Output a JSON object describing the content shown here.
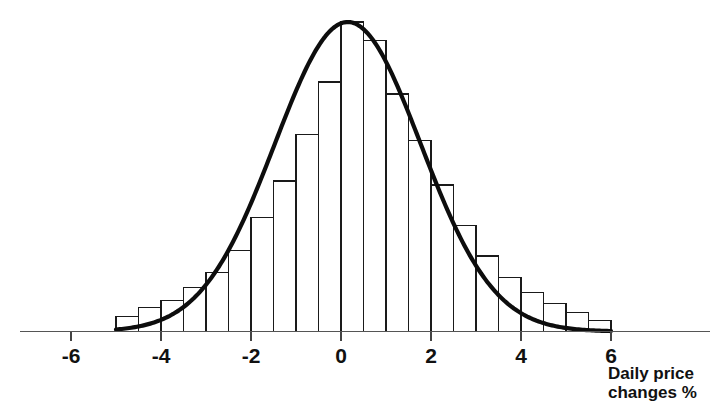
{
  "chart_data": {
    "type": "bar",
    "title": "",
    "subtitle": "",
    "xlabel": "Daily price changes %",
    "ylabel": "",
    "xlim": [
      -6.8,
      7.2
    ],
    "ylim": [
      0,
      1.0
    ],
    "grid": false,
    "legend": "none",
    "x_ticks": [
      -6,
      -4,
      -2,
      0,
      2,
      4,
      6
    ],
    "x_tick_labels": [
      "-6",
      "-4",
      "-2",
      "0",
      "2",
      "4",
      "6"
    ],
    "y_axis_visible": false,
    "bin_width": 0.5,
    "bin_left_edges": [
      -5.0,
      -4.5,
      -4.0,
      -3.5,
      -3.0,
      -2.5,
      -2.0,
      -1.5,
      -1.0,
      -0.5,
      0.0,
      0.5,
      1.0,
      1.5,
      2.0,
      2.5,
      3.0,
      3.5,
      4.0,
      4.5,
      5.0,
      5.5
    ],
    "bin_centers": [
      -4.75,
      -4.25,
      -3.75,
      -3.25,
      -2.75,
      -2.25,
      -1.75,
      -1.25,
      -0.75,
      -0.25,
      0.25,
      0.75,
      1.25,
      1.75,
      2.25,
      2.75,
      3.25,
      3.75,
      4.25,
      4.75,
      5.25,
      5.75
    ],
    "categories": [
      "-4.75",
      "-4.25",
      "-3.75",
      "-3.25",
      "-2.75",
      "-2.25",
      "-1.75",
      "-1.25",
      "-0.75",
      "-0.25",
      "0.25",
      "0.75",
      "1.25",
      "1.75",
      "2.25",
      "2.75",
      "3.25",
      "3.75",
      "4.25",
      "4.75",
      "5.25",
      "5.75"
    ],
    "values": [
      0.048,
      0.078,
      0.1,
      0.142,
      0.19,
      0.262,
      0.368,
      0.487,
      0.636,
      0.806,
      1.0,
      0.94,
      0.767,
      0.617,
      0.474,
      0.342,
      0.243,
      0.174,
      0.126,
      0.09,
      0.061,
      0.036
    ],
    "series": [
      {
        "name": "Frequency of daily price changes",
        "type": "bar",
        "values": [
          0.048,
          0.078,
          0.1,
          0.142,
          0.19,
          0.262,
          0.368,
          0.487,
          0.636,
          0.806,
          1.0,
          0.94,
          0.767,
          0.617,
          0.474,
          0.342,
          0.243,
          0.174,
          0.126,
          0.09,
          0.061,
          0.036
        ]
      },
      {
        "name": "Fitted normal curve",
        "type": "line",
        "mean": 0.15,
        "std_dev": 1.62,
        "peak_value": 1.0
      }
    ],
    "annotations": []
  },
  "axis": {
    "x_title_line1": "Daily price",
    "x_title_line2": "changes %"
  }
}
